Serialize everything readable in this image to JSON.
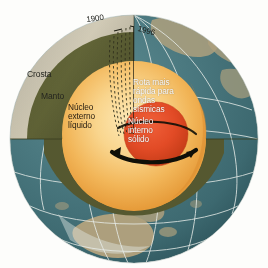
{
  "figure": {
    "language": "pt-BR",
    "background_color": "#fdfdfb"
  },
  "labels": {
    "crust": "Crosta",
    "mantle": "Manto",
    "outer_core": "Núcleo\nexterno\nlíquido",
    "inner_core": "Núcleo\ninterno\nsólido",
    "fast_route": "Rota mais\nrápida para\nondas\nsísmicas",
    "year_start": "1900",
    "year_end": "1996"
  },
  "layers": [
    {
      "name": "crust",
      "label": "Crosta",
      "color": "#cfc7ae"
    },
    {
      "name": "mantle",
      "label": "Manto",
      "color": "#5d6034"
    },
    {
      "name": "outer-core",
      "label": "Núcleo externo líquido",
      "color": "#f0ae4a"
    },
    {
      "name": "inner-core",
      "label": "Núcleo interno sólido",
      "color": "#e04a22"
    }
  ],
  "colors": {
    "ocean": "#436f77",
    "ocean_light": "#4e7d84",
    "land": "#b8a57f",
    "graticule": "#e4eae6",
    "crust": "#cfc7ae",
    "crust_light": "#ded8c3",
    "mantle": "#5d6034",
    "mantle_dark": "#4a4d2a",
    "outer_core_light": "#fbdc9c",
    "outer_core": "#f0ae4a",
    "outer_core_dark": "#e09030",
    "inner_core": "#e6502a",
    "inner_core_dark": "#c93a18",
    "ray_path": "#2b2b20",
    "rotation_arrow": "#141414"
  },
  "annotations": {
    "ray_paths_label": "seismic ray paths through inner core",
    "rotation_arrow_label": "inner core rotation direction"
  }
}
